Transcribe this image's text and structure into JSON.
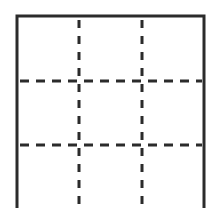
{
  "diagram": {
    "type": "grid",
    "rows": 3,
    "columns": 3,
    "border_color": "#2b2b2b",
    "line_color": "#2b2b2b",
    "background": "#ffffff",
    "outer_box": {
      "x": 17,
      "y": 16,
      "width": 187,
      "height": 200
    },
    "vertical_lines_x": [
      79,
      142
    ],
    "horizontal_lines_y": [
      81,
      145
    ]
  }
}
